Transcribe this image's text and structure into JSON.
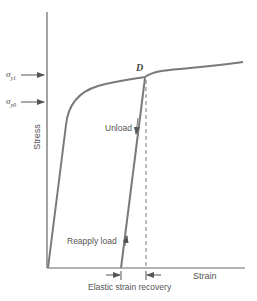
{
  "diagram": {
    "axes": {
      "x_label": "Strain",
      "y_label": "Stress"
    },
    "y_markers": [
      {
        "symbol": "σ",
        "subscript": "y1",
        "meaning": "yield stress after loading to D"
      },
      {
        "symbol": "σ",
        "subscript": "y0",
        "meaning": "initial yield stress"
      }
    ],
    "point_label": "D",
    "annotations": {
      "unload": "Unload",
      "reapply": "Reapply load",
      "elastic_recovery": "Elastic strain recovery"
    },
    "colors": {
      "curve": "#7a7a7a",
      "axis": "#555555",
      "text": "#555555"
    }
  }
}
